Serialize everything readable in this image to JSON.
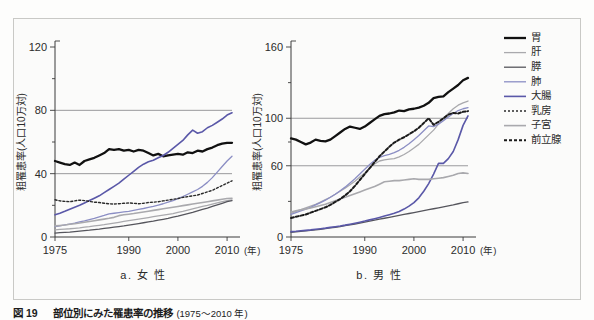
{
  "figure": {
    "caption_label": "図 19",
    "caption_title": "部位別にみた罹患率の推移",
    "caption_years": "(1975〜2010 年)"
  },
  "legend": {
    "position": "right",
    "items": [
      {
        "key": "stomach",
        "label": "胃",
        "color": "#111111",
        "width": 2.3,
        "dash": "none"
      },
      {
        "key": "liver",
        "label": "肝",
        "color": "#a9a9ad",
        "width": 1.3,
        "dash": "none"
      },
      {
        "key": "pancreas",
        "label": "膵",
        "color": "#55555c",
        "width": 1.3,
        "dash": "none"
      },
      {
        "key": "lung",
        "label": "肺",
        "color": "#8b8ec4",
        "width": 1.3,
        "dash": "none"
      },
      {
        "key": "colon",
        "label": "大腸",
        "color": "#5a58a8",
        "width": 1.6,
        "dash": "none"
      },
      {
        "key": "breast",
        "label": "乳房",
        "color": "#2b2b2b",
        "width": 1.4,
        "dash": "2,2"
      },
      {
        "key": "uterus",
        "label": "子宮",
        "color": "#a9a9ad",
        "width": 1.6,
        "dash": "none"
      },
      {
        "key": "prostate",
        "label": "前立腺",
        "color": "#1a1a1a",
        "width": 2.0,
        "dash": "3,2"
      }
    ]
  },
  "chart_data": [
    {
      "id": "female",
      "type": "line",
      "title": "a. 女 性",
      "xlabel": "(年)",
      "ylabel": "粗罹患率(人口10万対)",
      "xlim": [
        1975,
        2011
      ],
      "ylim": [
        0,
        120
      ],
      "xticks": [
        1975,
        1990,
        2000,
        2010
      ],
      "yticks": [
        0,
        40,
        80,
        120
      ],
      "gridlines": [
        40,
        80
      ],
      "x": [
        1975,
        1976,
        1977,
        1978,
        1979,
        1980,
        1981,
        1982,
        1983,
        1984,
        1985,
        1986,
        1987,
        1988,
        1989,
        1990,
        1991,
        1992,
        1993,
        1994,
        1995,
        1996,
        1997,
        1998,
        1999,
        2000,
        2001,
        2002,
        2003,
        2004,
        2005,
        2006,
        2007,
        2008,
        2009,
        2010,
        2011
      ],
      "series": [
        {
          "key": "stomach",
          "name": "胃",
          "values": [
            48.0,
            47.0,
            46.0,
            45.5,
            47.0,
            45.5,
            48.0,
            49.0,
            50.0,
            51.5,
            53.0,
            55.5,
            55.0,
            55.5,
            54.5,
            55.0,
            54.0,
            55.0,
            54.5,
            53.0,
            51.5,
            52.5,
            51.0,
            51.5,
            52.0,
            52.5,
            52.0,
            53.5,
            53.0,
            54.5,
            54.0,
            55.5,
            56.5,
            58.0,
            59.0,
            59.5,
            59.5
          ]
        },
        {
          "key": "liver",
          "name": "肝",
          "values": [
            4.5,
            4.8,
            5.0,
            5.2,
            5.5,
            5.8,
            6.2,
            6.5,
            7.0,
            7.4,
            7.8,
            8.3,
            8.8,
            9.3,
            9.8,
            10.3,
            10.8,
            11.3,
            11.8,
            12.3,
            12.8,
            13.3,
            13.8,
            14.3,
            14.8,
            15.5,
            16.2,
            17.0,
            17.8,
            18.5,
            19.3,
            20.0,
            20.8,
            21.6,
            22.4,
            23.0,
            23.5
          ]
        },
        {
          "key": "pancreas",
          "name": "膵",
          "values": [
            2.5,
            2.7,
            2.9,
            3.1,
            3.4,
            3.7,
            4.0,
            4.3,
            4.7,
            5.0,
            5.4,
            5.8,
            6.2,
            6.6,
            7.0,
            7.5,
            8.0,
            8.5,
            9.0,
            9.5,
            10.0,
            10.6,
            11.2,
            11.8,
            12.5,
            13.2,
            14.0,
            14.8,
            15.6,
            16.5,
            17.4,
            18.3,
            19.3,
            20.3,
            21.3,
            22.3,
            23.0
          ]
        },
        {
          "key": "lung",
          "name": "肺",
          "values": [
            6.5,
            7.0,
            7.6,
            8.2,
            8.8,
            9.5,
            10.2,
            11.0,
            11.8,
            12.7,
            13.6,
            14.6,
            15.0,
            15.4,
            15.8,
            16.2,
            16.8,
            17.4,
            18.0,
            18.7,
            19.4,
            20.2,
            21.0,
            22.0,
            23.0,
            24.2,
            25.5,
            27.0,
            28.5,
            30.0,
            32.0,
            34.5,
            37.5,
            41.0,
            44.5,
            48.0,
            51.0
          ]
        },
        {
          "key": "colon",
          "name": "大腸",
          "values": [
            14.0,
            15.0,
            16.2,
            17.5,
            18.8,
            20.0,
            21.5,
            23.0,
            24.5,
            26.0,
            28.0,
            30.0,
            32.0,
            34.0,
            36.5,
            39.0,
            41.5,
            44.0,
            46.0,
            47.5,
            48.5,
            50.0,
            51.5,
            53.5,
            56.0,
            58.5,
            61.0,
            64.5,
            67.5,
            65.5,
            66.5,
            69.0,
            70.5,
            72.5,
            74.5,
            77.0,
            78.5
          ]
        },
        {
          "key": "breast",
          "name": "乳房",
          "values": [
            23.5,
            22.8,
            22.5,
            22.3,
            22.8,
            23.3,
            23.0,
            22.5,
            22.0,
            21.8,
            21.3,
            21.0,
            20.8,
            21.0,
            21.3,
            21.5,
            21.3,
            21.0,
            21.3,
            21.8,
            22.0,
            22.3,
            22.8,
            23.3,
            23.8,
            24.3,
            25.0,
            25.5,
            26.0,
            26.5,
            27.5,
            28.5,
            29.5,
            31.0,
            32.5,
            34.0,
            35.5
          ]
        },
        {
          "key": "uterus",
          "name": "子宮",
          "values": [
            7.0,
            7.3,
            7.6,
            8.0,
            8.4,
            8.8,
            9.3,
            9.8,
            10.3,
            10.8,
            11.3,
            11.8,
            12.4,
            13.5,
            14.0,
            14.4,
            14.8,
            15.3,
            15.8,
            16.3,
            16.8,
            17.3,
            17.8,
            18.3,
            18.8,
            19.3,
            19.8,
            20.3,
            20.8,
            21.3,
            21.8,
            22.3,
            22.8,
            23.3,
            23.8,
            24.3,
            24.5
          ]
        }
      ]
    },
    {
      "id": "male",
      "type": "line",
      "title": "b. 男 性",
      "xlabel": "(年)",
      "ylabel": "粗罹患率(人口10万対)",
      "xlim": [
        1975,
        2011
      ],
      "ylim": [
        0,
        160
      ],
      "xticks": [
        1975,
        1990,
        2000,
        2010
      ],
      "yticks": [
        0,
        60,
        100,
        160
      ],
      "gridlines": [
        60,
        100
      ],
      "x": [
        1975,
        1976,
        1977,
        1978,
        1979,
        1980,
        1981,
        1982,
        1983,
        1984,
        1985,
        1986,
        1987,
        1988,
        1989,
        1990,
        1991,
        1992,
        1993,
        1994,
        1995,
        1996,
        1997,
        1998,
        1999,
        2000,
        2001,
        2002,
        2003,
        2004,
        2005,
        2006,
        2007,
        2008,
        2009,
        2010,
        2011
      ],
      "series": [
        {
          "key": "stomach",
          "name": "胃",
          "values": [
            83.0,
            82.0,
            80.0,
            78.0,
            79.5,
            82.0,
            81.0,
            80.5,
            82.0,
            85.0,
            88.0,
            91.0,
            93.0,
            92.0,
            91.0,
            93.0,
            96.0,
            99.0,
            102.0,
            103.5,
            104.0,
            105.0,
            106.5,
            106.0,
            107.5,
            108.0,
            109.0,
            110.5,
            113.0,
            117.0,
            118.0,
            118.5,
            122.0,
            125.0,
            128.0,
            132.0,
            134.0
          ]
        },
        {
          "key": "liver",
          "name": "肝",
          "values": [
            20.0,
            21.5,
            23.0,
            24.5,
            26.0,
            27.5,
            29.5,
            31.5,
            33.5,
            36.0,
            38.5,
            41.0,
            44.0,
            47.0,
            50.5,
            54.0,
            58.0,
            61.5,
            64.0,
            65.0,
            65.5,
            66.0,
            67.5,
            69.5,
            72.0,
            75.0,
            78.0,
            82.0,
            86.0,
            90.0,
            95.0,
            100.0,
            104.0,
            108.0,
            111.0,
            113.0,
            114.5
          ]
        },
        {
          "key": "pancreas",
          "name": "膵",
          "values": [
            4.0,
            4.3,
            4.7,
            5.1,
            5.5,
            6.0,
            6.5,
            7.0,
            7.6,
            8.2,
            8.8,
            9.5,
            10.2,
            10.9,
            11.7,
            12.5,
            13.3,
            14.2,
            15.0,
            15.8,
            16.6,
            17.4,
            18.2,
            19.0,
            19.8,
            20.6,
            21.4,
            22.2,
            23.0,
            23.8,
            24.6,
            25.4,
            26.2,
            27.0,
            28.0,
            29.0,
            29.5
          ]
        },
        {
          "key": "lung",
          "name": "肺",
          "values": [
            19.0,
            20.5,
            22.0,
            23.5,
            25.0,
            27.0,
            29.0,
            31.0,
            33.5,
            36.0,
            39.0,
            42.0,
            45.5,
            49.0,
            53.0,
            57.0,
            61.0,
            64.5,
            67.0,
            68.5,
            69.5,
            71.0,
            73.0,
            75.5,
            78.5,
            82.0,
            85.5,
            89.5,
            93.5,
            93.0,
            95.0,
            98.0,
            101.0,
            104.0,
            106.5,
            108.0,
            109.0
          ]
        },
        {
          "key": "colon",
          "name": "大腸",
          "values": [
            4.5,
            4.8,
            5.2,
            5.6,
            6.0,
            6.5,
            7.0,
            7.5,
            8.1,
            8.7,
            9.3,
            10.0,
            10.8,
            11.6,
            12.5,
            13.4,
            14.4,
            15.4,
            16.5,
            17.6,
            18.8,
            20.0,
            21.5,
            23.5,
            26.0,
            29.0,
            33.0,
            38.5,
            45.0,
            53.0,
            62.0,
            62.0,
            66.0,
            72.0,
            82.0,
            94.0,
            102.0
          ]
        },
        {
          "key": "uterus",
          "name": "子宮",
          "values": [
            21.0,
            22.0,
            23.0,
            23.5,
            24.5,
            25.5,
            26.5,
            27.5,
            29.0,
            30.5,
            32.0,
            33.5,
            35.0,
            36.5,
            38.0,
            39.5,
            41.0,
            42.5,
            44.5,
            46.5,
            47.0,
            47.5,
            47.5,
            48.0,
            48.5,
            49.0,
            48.5,
            48.5,
            48.5,
            49.0,
            49.5,
            50.0,
            51.0,
            52.0,
            53.5,
            54.0,
            53.5
          ]
        },
        {
          "key": "prostate",
          "name": "前立腺",
          "values": [
            16.0,
            17.0,
            18.0,
            19.0,
            20.5,
            22.0,
            23.5,
            25.0,
            27.0,
            29.5,
            32.0,
            35.0,
            38.5,
            43.0,
            48.0,
            53.0,
            58.0,
            63.0,
            68.0,
            72.0,
            76.0,
            79.5,
            82.0,
            84.0,
            86.5,
            89.0,
            92.0,
            96.0,
            100.0,
            94.5,
            97.0,
            100.0,
            103.0,
            104.5,
            104.0,
            105.5,
            106.0
          ]
        }
      ]
    }
  ]
}
